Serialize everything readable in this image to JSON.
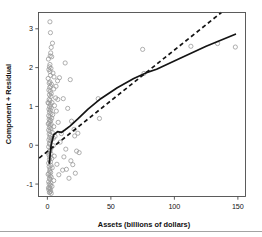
{
  "figure": {
    "background": "#ffffff",
    "point_color": "#9a9a9a",
    "line_color": "#141414",
    "axis_color": "#4a4a4a",
    "footer_rule_color": "#8c8c8c"
  },
  "chart_data": {
    "type": "scatter",
    "title": "",
    "xlabel": "Assets (billions of dollars)",
    "ylabel": "Component + Residual",
    "xlim": [
      -7,
      156
    ],
    "ylim": [
      -1.32,
      3.42
    ],
    "xticks": [
      0,
      50,
      100,
      150
    ],
    "xtick_labels": [
      "0",
      "50",
      "100",
      "150"
    ],
    "yticks": [
      -1,
      0,
      1,
      2,
      3
    ],
    "ytick_labels": [
      "-1",
      "0",
      "1",
      "2",
      "3"
    ],
    "grid": false,
    "legend": "none",
    "marker": "open-circle",
    "points": [
      [
        2.0,
        3.18
      ],
      [
        2.4,
        2.9
      ],
      [
        4.0,
        2.63
      ],
      [
        3.0,
        2.52
      ],
      [
        2.6,
        2.38
      ],
      [
        2.2,
        2.3
      ],
      [
        3.4,
        2.28
      ],
      [
        14.0,
        2.12
      ],
      [
        2.0,
        2.08
      ],
      [
        1.6,
        2.02
      ],
      [
        2.8,
        1.98
      ],
      [
        1.2,
        1.95
      ],
      [
        2.0,
        1.9
      ],
      [
        4.4,
        1.86
      ],
      [
        2.4,
        1.8
      ],
      [
        9.5,
        1.74
      ],
      [
        18.0,
        1.69
      ],
      [
        8.0,
        1.66
      ],
      [
        2.0,
        1.63
      ],
      [
        1.4,
        1.6
      ],
      [
        3.2,
        1.57
      ],
      [
        2.6,
        1.52
      ],
      [
        1.8,
        1.49
      ],
      [
        5.0,
        1.45
      ],
      [
        1.2,
        1.42
      ],
      [
        2.2,
        1.38
      ],
      [
        3.0,
        1.33
      ],
      [
        1.6,
        1.3
      ],
      [
        2.8,
        1.26
      ],
      [
        6.5,
        1.22
      ],
      [
        40.0,
        1.2
      ],
      [
        1.4,
        1.18
      ],
      [
        2.0,
        1.15
      ],
      [
        3.6,
        1.1
      ],
      [
        1.0,
        1.08
      ],
      [
        2.4,
        1.05
      ],
      [
        5.6,
        1.02
      ],
      [
        1.8,
        0.99
      ],
      [
        3.0,
        0.96
      ],
      [
        1.2,
        0.93
      ],
      [
        2.2,
        0.9
      ],
      [
        7.0,
        0.88
      ],
      [
        1.6,
        0.85
      ],
      [
        2.8,
        0.82
      ],
      [
        4.2,
        0.79
      ],
      [
        1.0,
        0.76
      ],
      [
        2.0,
        0.73
      ],
      [
        3.4,
        0.7
      ],
      [
        41.0,
        0.69
      ],
      [
        1.4,
        0.67
      ],
      [
        2.6,
        0.64
      ],
      [
        1.8,
        0.61
      ],
      [
        8.5,
        0.59
      ],
      [
        1.2,
        0.57
      ],
      [
        3.0,
        0.54
      ],
      [
        2.2,
        0.51
      ],
      [
        5.0,
        0.48
      ],
      [
        1.6,
        0.46
      ],
      [
        2.8,
        0.43
      ],
      [
        21.0,
        0.41
      ],
      [
        1.0,
        0.39
      ],
      [
        2.0,
        0.36
      ],
      [
        3.8,
        0.33
      ],
      [
        24.0,
        0.31
      ],
      [
        1.4,
        0.29
      ],
      [
        2.4,
        0.26
      ],
      [
        6.0,
        0.23
      ],
      [
        1.8,
        0.2
      ],
      [
        3.2,
        0.17
      ],
      [
        1.2,
        0.14
      ],
      [
        2.6,
        0.11
      ],
      [
        10.0,
        0.08
      ],
      [
        1.6,
        0.05
      ],
      [
        2.0,
        0.02
      ],
      [
        4.6,
        -0.01
      ],
      [
        1.0,
        -0.04
      ],
      [
        3.0,
        -0.07
      ],
      [
        14.5,
        -0.1
      ],
      [
        2.2,
        -0.13
      ],
      [
        1.8,
        -0.16
      ],
      [
        25.0,
        -0.19
      ],
      [
        2.8,
        -0.22
      ],
      [
        1.2,
        -0.25
      ],
      [
        5.4,
        -0.28
      ],
      [
        2.0,
        -0.31
      ],
      [
        3.4,
        -0.34
      ],
      [
        1.6,
        -0.37
      ],
      [
        18.5,
        -0.4
      ],
      [
        2.4,
        -0.43
      ],
      [
        1.0,
        -0.46
      ],
      [
        7.5,
        -0.49
      ],
      [
        2.8,
        -0.52
      ],
      [
        1.4,
        -0.55
      ],
      [
        3.8,
        -0.58
      ],
      [
        2.0,
        -0.61
      ],
      [
        12.0,
        -0.64
      ],
      [
        1.8,
        -0.67
      ],
      [
        2.6,
        -0.7
      ],
      [
        1.2,
        -0.73
      ],
      [
        9.0,
        -0.76
      ],
      [
        2.2,
        -0.79
      ],
      [
        3.0,
        -0.82
      ],
      [
        1.6,
        -0.85
      ],
      [
        2.0,
        -0.88
      ],
      [
        5.0,
        -0.91
      ],
      [
        1.0,
        -0.94
      ],
      [
        2.8,
        -0.97
      ],
      [
        1.4,
        -1.0
      ],
      [
        2.4,
        -1.03
      ],
      [
        3.6,
        -1.06
      ],
      [
        1.8,
        -1.09
      ],
      [
        2.2,
        -1.12
      ],
      [
        1.2,
        -1.15
      ],
      [
        2.6,
        -1.18
      ],
      [
        2.0,
        -1.2
      ],
      [
        1.6,
        -1.22
      ],
      [
        3.0,
        -1.24
      ],
      [
        75.0,
        2.47
      ],
      [
        76.0,
        1.85
      ],
      [
        113.0,
        2.55
      ],
      [
        134.0,
        2.62
      ],
      [
        148.0,
        2.53
      ],
      [
        21.5,
        0.24
      ],
      [
        23.0,
        -0.15
      ],
      [
        19.0,
        0.62
      ],
      [
        16.0,
        0.95
      ],
      [
        12.5,
        1.2
      ],
      [
        11.0,
        0.3
      ],
      [
        13.0,
        -0.3
      ],
      [
        15.0,
        -0.62
      ],
      [
        17.0,
        -0.85
      ],
      [
        20.0,
        -0.5
      ],
      [
        22.0,
        -0.72
      ],
      [
        8.2,
        1.18
      ],
      [
        6.8,
        1.52
      ],
      [
        5.2,
        1.76
      ],
      [
        4.8,
        0.18
      ],
      [
        0.8,
        2.22
      ],
      [
        0.6,
        1.72
      ],
      [
        0.5,
        1.1
      ],
      [
        0.7,
        0.55
      ],
      [
        0.9,
        -0.2
      ],
      [
        0.6,
        -0.75
      ],
      [
        0.8,
        -1.1
      ]
    ],
    "smoother_line": {
      "style": "solid",
      "label": "loess smoother",
      "points": [
        [
          1.5,
          -0.46
        ],
        [
          3.0,
          0.02
        ],
        [
          5.0,
          0.27
        ],
        [
          8.0,
          0.35
        ],
        [
          11.0,
          0.33
        ],
        [
          14.0,
          0.4
        ],
        [
          18.0,
          0.5
        ],
        [
          24.0,
          0.68
        ],
        [
          32.0,
          0.93
        ],
        [
          42.0,
          1.2
        ],
        [
          55.0,
          1.48
        ],
        [
          68.0,
          1.72
        ],
        [
          78.0,
          1.87
        ],
        [
          86.0,
          1.96
        ],
        [
          105.0,
          2.25
        ],
        [
          125.0,
          2.55
        ],
        [
          148.0,
          2.86
        ]
      ]
    },
    "linear_fit_line": {
      "style": "dashed",
      "label": "linear partial fit",
      "points": [
        [
          -6.5,
          -0.33
        ],
        [
          137.0,
          3.42
        ]
      ]
    }
  }
}
